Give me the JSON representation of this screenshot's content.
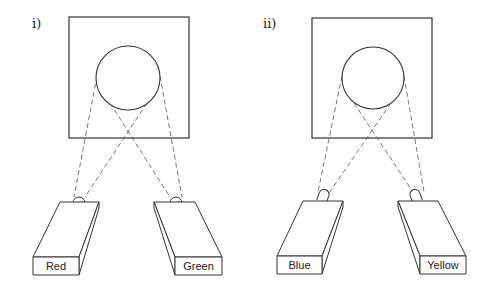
{
  "diagram": {
    "colors": {
      "line": "#333333",
      "beam": "#555555",
      "background": "#ffffff"
    },
    "panels": [
      {
        "id": "i",
        "label": "i)",
        "label_pos": [
          32,
          28
        ],
        "screen": {
          "x": 69,
          "y": 17,
          "w": 120,
          "h": 121
        },
        "object": {
          "cx": 128,
          "cy": 78,
          "r": 32
        },
        "projectors": [
          {
            "name": "Red",
            "label": "Red",
            "front": {
              "x": 33,
              "y": 257,
              "w": 46,
              "h": 18
            },
            "top": [
              [
                60,
                202
              ],
              [
                99,
                202
              ],
              [
                79,
                257
              ],
              [
                33,
                257
              ]
            ],
            "side": [
              [
                99,
                202
              ],
              [
                99,
                208
              ],
              [
                79,
                275
              ],
              [
                79,
                257
              ]
            ],
            "lens": {
              "cx": 79,
              "cy": 202,
              "r": 6,
              "tilt": 0
            },
            "beams": [
              [
                [
                  97,
                  76
                ],
                [
                  74,
                  197
                ]
              ],
              [
                [
                  147,
                  103
                ],
                [
                  85,
                  197
                ]
              ]
            ]
          },
          {
            "name": "Green",
            "label": "Green",
            "front": {
              "x": 175,
              "y": 257,
              "w": 47,
              "h": 18
            },
            "top": [
              [
                154,
                202
              ],
              [
                195,
                202
              ],
              [
                222,
                257
              ],
              [
                175,
                257
              ]
            ],
            "side": [
              [
                154,
                202
              ],
              [
                154,
                208
              ],
              [
                175,
                275
              ],
              [
                175,
                257
              ]
            ],
            "lens": {
              "cx": 176,
              "cy": 202,
              "r": 6,
              "tilt": 0
            },
            "beams": [
              [
                [
                  110,
                  103
                ],
                [
                  170,
                  197
                ]
              ],
              [
                [
                  160,
                  76
                ],
                [
                  182,
                  197
                ]
              ]
            ]
          }
        ]
      },
      {
        "id": "ii",
        "label": "ii)",
        "label_pos": [
          263,
          28
        ],
        "screen": {
          "x": 312,
          "y": 18,
          "w": 120,
          "h": 120
        },
        "object": {
          "cx": 373,
          "cy": 78,
          "r": 31
        },
        "projectors": [
          {
            "name": "Blue",
            "label": "Blue",
            "front": {
              "x": 277,
              "y": 256,
              "w": 45,
              "h": 18
            },
            "top": [
              [
                303,
                201
              ],
              [
                343,
                201
              ],
              [
                322,
                256
              ],
              [
                277,
                256
              ]
            ],
            "side": [
              [
                343,
                201
              ],
              [
                343,
                207
              ],
              [
                322,
                274
              ],
              [
                322,
                256
              ]
            ],
            "lens": {
              "cx": 322,
              "cy": 196,
              "r": 6,
              "tilt": 20
            },
            "beams": [
              [
                [
                  342,
                  76
                ],
                [
                  318,
                  192
                ]
              ],
              [
                [
                  391,
                  103
                ],
                [
                  329,
                  193
                ]
              ]
            ]
          },
          {
            "name": "Yellow",
            "label": "Yellow",
            "front": {
              "x": 420,
              "y": 256,
              "w": 46,
              "h": 18
            },
            "top": [
              [
                398,
                201
              ],
              [
                438,
                201
              ],
              [
                466,
                256
              ],
              [
                420,
                256
              ]
            ],
            "side": [
              [
                398,
                201
              ],
              [
                398,
                207
              ],
              [
                420,
                274
              ],
              [
                420,
                256
              ]
            ],
            "lens": {
              "cx": 417,
              "cy": 196,
              "r": 6,
              "tilt": -20
            },
            "beams": [
              [
                [
                  354,
                  103
                ],
                [
                  413,
                  192
                ]
              ],
              [
                [
                  404,
                  76
                ],
                [
                  424,
                  192
                ]
              ]
            ]
          }
        ]
      }
    ]
  }
}
